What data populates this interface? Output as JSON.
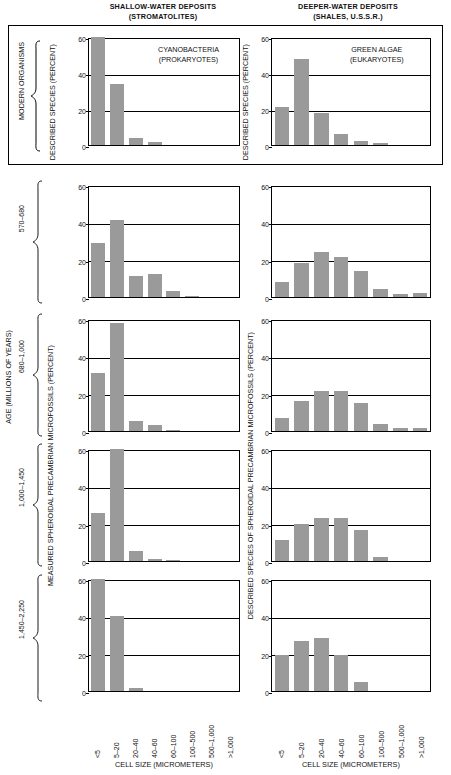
{
  "figure": {
    "column_headers": [
      {
        "line1": "SHALLOW-WATER DEPOSITS",
        "line2": "(STROMATOLITES)"
      },
      {
        "line1": "DEEPER-WATER DEPOSITS",
        "line2": "(SHALES, U.S.S.R.)"
      }
    ],
    "modern_group_label": "MODERN ORGANISMS",
    "age_axis_label": "AGE (MILLIONS OF YEARS)",
    "left_axis_label_modern": "DESCRIBED SPECIES (PERCENT)",
    "left_axis_label_fossil": "MEASURED SPHEROIDAL PRECAMBRIAN MICROFOSSILS (PERCENT)",
    "right_axis_label_modern": "DESCRIBED SPECIES (PERCENT)",
    "right_axis_label_fossil": "DESCRIBED SPECIES OF SPHEROIDAL PRECAMBRIAN MICROFOSSILS (PERCENT)",
    "x_axis_title": "CELL SIZE (MICROMETERS)",
    "bar_color": "#9a9a9a",
    "axis_color": "#000000",
    "age_rows": [
      "570–680",
      "680–1,000",
      "1,000–1,450",
      "1,450–2,250"
    ]
  },
  "chart_data": [
    {
      "type": "bar",
      "title": "CYANOBACTERIA\n(PROKARYOTES)",
      "title_line1": "CYANOBACTERIA",
      "title_line2": "(PROKARYOTES)",
      "panel": "modern-left",
      "column": "SHALLOW-WATER DEPOSITS (STROMATOLITES)",
      "row": "MODERN ORGANISMS",
      "categories": [
        "<5",
        "5–20",
        "20–40",
        "40–60",
        "60–100",
        "100–500",
        "500–1,000",
        ">1,000"
      ],
      "values": [
        60,
        34,
        4,
        1.5,
        0,
        0,
        0,
        0
      ],
      "xlabel": "CELL SIZE (MICROMETERS)",
      "ylabel": "DESCRIBED SPECIES (PERCENT)",
      "ylim": [
        0,
        60
      ],
      "yticks": [
        0,
        20,
        40,
        60
      ],
      "grid": true,
      "legend": "none"
    },
    {
      "type": "bar",
      "title": "GREEN ALGAE\n(EUKARYOTES)",
      "title_line1": "GREEN ALGAE",
      "title_line2": "(EUKARYOTES)",
      "panel": "modern-right",
      "column": "DEEPER-WATER DEPOSITS (SHALES, U.S.S.R.)",
      "row": "MODERN ORGANISMS",
      "categories": [
        "<5",
        "5–20",
        "20–40",
        "40–60",
        "60–100",
        "100–500",
        "500–1,000",
        ">1,000"
      ],
      "values": [
        21,
        48,
        18,
        6,
        2.5,
        1,
        0,
        0
      ],
      "xlabel": "CELL SIZE (MICROMETERS)",
      "ylabel": "DESCRIBED SPECIES (PERCENT)",
      "ylim": [
        0,
        60
      ],
      "yticks": [
        0,
        20,
        40,
        60
      ],
      "grid": true,
      "legend": "none"
    },
    {
      "type": "bar",
      "panel": "row1-left",
      "column": "SHALLOW-WATER DEPOSITS (STROMATOLITES)",
      "row": "570–680",
      "categories": [
        "<5",
        "5–20",
        "20–40",
        "40–60",
        "60–100",
        "100–500",
        "500–1,000",
        ">1,000"
      ],
      "values": [
        29,
        41,
        11,
        12.5,
        3,
        0.5,
        0,
        0
      ],
      "ylim": [
        0,
        60
      ],
      "yticks": [
        0,
        20,
        40,
        60
      ],
      "grid": true
    },
    {
      "type": "bar",
      "panel": "row1-right",
      "column": "DEEPER-WATER DEPOSITS (SHALES, U.S.S.R.)",
      "row": "570–680",
      "categories": [
        "<5",
        "5–20",
        "20–40",
        "40–60",
        "60–100",
        "100–500",
        "500–1,000",
        ">1,000"
      ],
      "values": [
        8,
        18,
        24,
        21.5,
        14,
        4.5,
        1.5,
        2
      ],
      "ylim": [
        0,
        60
      ],
      "yticks": [
        0,
        20,
        40,
        60
      ],
      "grid": true
    },
    {
      "type": "bar",
      "panel": "row2-left",
      "column": "SHALLOW-WATER DEPOSITS (STROMATOLITES)",
      "row": "680–1,000",
      "categories": [
        "<5",
        "5–20",
        "20–40",
        "40–60",
        "60–100",
        "100–500",
        "500–1,000",
        ">1,000"
      ],
      "values": [
        31,
        58,
        5.5,
        3,
        0.8,
        0,
        0,
        0
      ],
      "ylim": [
        0,
        60
      ],
      "yticks": [
        0,
        20,
        40,
        60
      ],
      "grid": true
    },
    {
      "type": "bar",
      "panel": "row2-right",
      "column": "DEEPER-WATER DEPOSITS (SHALES, U.S.S.R.)",
      "row": "680–1,000",
      "categories": [
        "<5",
        "5–20",
        "20–40",
        "40–60",
        "60–100",
        "100–500",
        "500–1,000",
        ">1,000"
      ],
      "values": [
        7,
        16,
        21.5,
        21.5,
        15,
        4,
        1.5,
        1.5
      ],
      "ylim": [
        0,
        60
      ],
      "yticks": [
        0,
        20,
        40,
        60
      ],
      "grid": true
    },
    {
      "type": "bar",
      "panel": "row3-left",
      "column": "SHALLOW-WATER DEPOSITS (STROMATOLITES)",
      "row": "1,000–1,450",
      "categories": [
        "<5",
        "5–20",
        "20–40",
        "40–60",
        "60–100",
        "100–500",
        "500–1,000",
        ">1,000"
      ],
      "values": [
        25.5,
        63,
        5.5,
        1,
        0.5,
        0,
        0,
        0
      ],
      "ylim": [
        0,
        60
      ],
      "yticks": [
        0,
        20,
        40,
        60
      ],
      "grid": true
    },
    {
      "type": "bar",
      "panel": "row3-right",
      "column": "DEEPER-WATER DEPOSITS (SHALES, U.S.S.R.)",
      "row": "1,000–1,450",
      "categories": [
        "<5",
        "5–20",
        "20–40",
        "40–60",
        "60–100",
        "100–500",
        "500–1,000",
        ">1,000"
      ],
      "values": [
        11,
        20,
        23,
        23,
        16.5,
        2,
        0,
        0
      ],
      "ylim": [
        0,
        60
      ],
      "yticks": [
        0,
        20,
        40,
        60
      ],
      "grid": true
    },
    {
      "type": "bar",
      "panel": "row4-left",
      "column": "SHALLOW-WATER DEPOSITS (STROMATOLITES)",
      "row": "1,450–2,250",
      "categories": [
        "<5",
        "5–20",
        "20–40",
        "40–60",
        "60–100",
        "100–500",
        "500–1,000",
        ">1,000"
      ],
      "values": [
        60,
        40,
        1.5,
        0,
        0,
        0,
        0,
        0
      ],
      "ylim": [
        0,
        60
      ],
      "yticks": [
        0,
        20,
        40,
        60
      ],
      "grid": true
    },
    {
      "type": "bar",
      "panel": "row4-right",
      "column": "DEEPER-WATER DEPOSITS (SHALES, U.S.S.R.)",
      "row": "1,450–2,250",
      "categories": [
        "<5",
        "5–20",
        "20–40",
        "40–60",
        "60–100",
        "100–500",
        "500–1,000",
        ">1,000"
      ],
      "values": [
        19.5,
        27,
        28.5,
        19.5,
        5,
        0,
        0,
        0
      ],
      "ylim": [
        0,
        60
      ],
      "yticks": [
        0,
        20,
        40,
        60
      ],
      "grid": true
    }
  ]
}
